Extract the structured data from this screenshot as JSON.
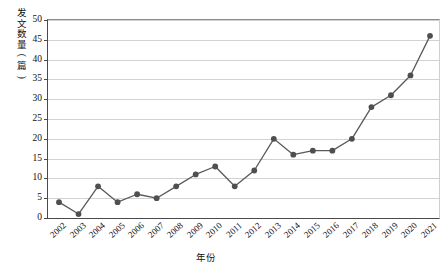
{
  "chart_data": {
    "type": "line",
    "title": "",
    "subtitle": "",
    "xlabel": "年份",
    "ylabel": "发文数量(篇)",
    "ylabel_chars": [
      "发",
      "文",
      "数",
      "量",
      "(",
      "篇",
      ")"
    ],
    "categories": [
      "2002",
      "2003",
      "2004",
      "2005",
      "2006",
      "2007",
      "2008",
      "2009",
      "2010",
      "2011",
      "2012",
      "2013",
      "2014",
      "2015",
      "2016",
      "2017",
      "2018",
      "2019",
      "2020",
      "2021"
    ],
    "values": [
      4,
      1,
      8,
      4,
      6,
      5,
      8,
      11,
      13,
      8,
      12,
      20,
      16,
      17,
      17,
      20,
      28,
      31,
      36,
      46
    ],
    "series": [
      {
        "name": "发文数量",
        "values": [
          4,
          1,
          8,
          4,
          6,
          5,
          8,
          11,
          13,
          8,
          12,
          20,
          16,
          17,
          17,
          20,
          28,
          31,
          36,
          46
        ]
      }
    ],
    "ylim": [
      0,
      50
    ],
    "ytick_labels": [
      "0",
      "5",
      "10",
      "15",
      "20",
      "25",
      "30",
      "35",
      "40",
      "45",
      "50"
    ],
    "ytick_values": [
      0,
      5,
      10,
      15,
      20,
      25,
      30,
      35,
      40,
      45,
      50
    ],
    "xtick_labels": [
      "2002",
      "2003",
      "2004",
      "2005",
      "2006",
      "2007",
      "2008",
      "2009",
      "2010",
      "2011",
      "2012",
      "2013",
      "2014",
      "2015",
      "2016",
      "2017",
      "2018",
      "2019",
      "2020",
      "2021"
    ],
    "grid": true,
    "grid_axis": "y",
    "legend": false,
    "legend_position": "none",
    "marker": "circle",
    "colors": {
      "line": "#595959",
      "marker": "#4f4f4f",
      "grid": "#d2d2d2",
      "axis": "#4a4a4a",
      "text": "#111111",
      "background": "#ffffff"
    }
  }
}
